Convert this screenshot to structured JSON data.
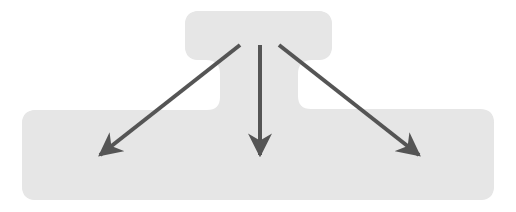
{
  "diagram": {
    "type": "one-to-many fan-out",
    "colors": {
      "background": "#ffffff",
      "shape_fill": "#e6e6e6",
      "arrow": "#555555"
    },
    "nodes": [
      {
        "id": "source",
        "label": "",
        "role": "top box"
      },
      {
        "id": "target",
        "label": "",
        "role": "bottom wide box"
      }
    ],
    "arrows": [
      {
        "id": "arrow-left",
        "direction": "down-left",
        "from": [
          240,
          45
        ],
        "to": [
          98,
          157
        ]
      },
      {
        "id": "arrow-down",
        "direction": "down",
        "from": [
          260,
          45
        ],
        "to": [
          260,
          157
        ]
      },
      {
        "id": "arrow-right",
        "direction": "down-right",
        "from": [
          279,
          45
        ],
        "to": [
          421,
          157
        ]
      }
    ],
    "arrow_count": 3
  }
}
